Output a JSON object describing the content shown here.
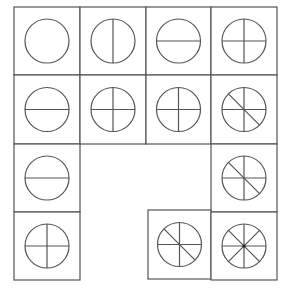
{
  "grid": {
    "rows": 4,
    "cols": 4
  },
  "cells": [
    {
      "row": 0,
      "col": 0,
      "lines": []
    },
    {
      "row": 0,
      "col": 1,
      "lines": [
        "vertical"
      ]
    },
    {
      "row": 0,
      "col": 2,
      "lines": [
        "horizontal"
      ]
    },
    {
      "row": 0,
      "col": 3,
      "lines": [
        "vertical",
        "horizontal"
      ]
    },
    {
      "row": 1,
      "col": 0,
      "lines": [
        "horizontal"
      ]
    },
    {
      "row": 1,
      "col": 1,
      "lines": [
        "vertical",
        "horizontal"
      ]
    },
    {
      "row": 1,
      "col": 2,
      "lines": [
        "vertical",
        "horizontal"
      ]
    },
    {
      "row": 1,
      "col": 3,
      "lines": [
        "vertical",
        "horizontal",
        "diag-tl-br"
      ]
    },
    {
      "row": 2,
      "col": 0,
      "lines": [
        "horizontal"
      ]
    },
    {
      "row": 2,
      "col": 3,
      "lines": [
        "vertical",
        "horizontal",
        "diag-tl-br"
      ]
    },
    {
      "row": 3,
      "col": 0,
      "lines": [
        "vertical",
        "horizontal"
      ]
    },
    {
      "row": 3,
      "col": 2,
      "lines": [
        "vertical",
        "horizontal",
        "diag-tl-br"
      ]
    },
    {
      "row": 3,
      "col": 3,
      "lines": [
        "vertical",
        "horizontal",
        "diag-tl-br",
        "diag-tr-bl"
      ],
      "center_dot": true
    }
  ],
  "colors": {
    "stroke": "#555555",
    "background": "#ffffff"
  }
}
